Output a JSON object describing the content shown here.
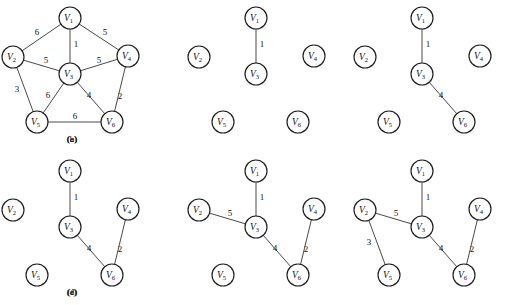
{
  "figure": {
    "background_color": "#ffffff",
    "node_stroke_color": "#1d1d1d",
    "edge_stroke_color": "#4a4a4a",
    "text_color": "#111111",
    "node_radius": 11
  },
  "vertex_labels": {
    "v1": "V",
    "v2": "V",
    "v3": "V",
    "v4": "V",
    "v5": "V",
    "v6": "V",
    "s1": "1",
    "s2": "2",
    "s3": "3",
    "s4": "4",
    "s5": "5",
    "s6": "6"
  },
  "panels": [
    {
      "id": "panel-a",
      "caption": "(a)",
      "caption_pos": {
        "x": 72,
        "y": 141
      },
      "origin": {
        "x": 0,
        "y": 0
      },
      "nodes": [
        {
          "id": "V1",
          "letter": "V",
          "sub": "1",
          "x": 70,
          "y": 18
        },
        {
          "id": "V2",
          "letter": "V",
          "sub": "2",
          "x": 13,
          "y": 57
        },
        {
          "id": "V3",
          "letter": "V",
          "sub": "3",
          "x": 70,
          "y": 74
        },
        {
          "id": "V4",
          "letter": "V",
          "sub": "4",
          "x": 128,
          "y": 56
        },
        {
          "id": "V5",
          "letter": "V",
          "sub": "5",
          "x": 37,
          "y": 122
        },
        {
          "id": "V6",
          "letter": "V",
          "sub": "6",
          "x": 112,
          "y": 122
        }
      ],
      "edges": [
        {
          "from": "V1",
          "to": "V2",
          "weight": "6",
          "label_x": 37,
          "label_y": 33
        },
        {
          "from": "V1",
          "to": "V3",
          "weight": "1",
          "label_x": 76,
          "label_y": 45
        },
        {
          "from": "V1",
          "to": "V4",
          "weight": "5",
          "label_x": 105,
          "label_y": 33
        },
        {
          "from": "V2",
          "to": "V3",
          "weight": "5",
          "label_x": 46,
          "label_y": 61
        },
        {
          "from": "V2",
          "to": "V5",
          "weight": "3",
          "label_x": 17,
          "label_y": 90
        },
        {
          "from": "V3",
          "to": "V4",
          "weight": "5",
          "label_x": 99,
          "label_y": 61
        },
        {
          "from": "V3",
          "to": "V5",
          "weight": "6",
          "label_x": 48,
          "label_y": 96
        },
        {
          "from": "V3",
          "to": "V6",
          "weight": "4",
          "label_x": 89,
          "label_y": 96
        },
        {
          "from": "V4",
          "to": "V6",
          "weight": "2",
          "label_x": 120,
          "label_y": 97
        },
        {
          "from": "V5",
          "to": "V6",
          "weight": "6",
          "label_x": 75,
          "label_y": 117
        }
      ]
    },
    {
      "id": "panel-b",
      "caption": "(b)",
      "caption_pos": {
        "x": 72,
        "y": 141
      },
      "origin": {
        "x": 186,
        "y": 0
      },
      "nodes": [
        {
          "id": "V1",
          "letter": "V",
          "sub": "1",
          "x": 70,
          "y": 18
        },
        {
          "id": "V2",
          "letter": "V",
          "sub": "2",
          "x": 13,
          "y": 57
        },
        {
          "id": "V3",
          "letter": "V",
          "sub": "3",
          "x": 70,
          "y": 74
        },
        {
          "id": "V4",
          "letter": "V",
          "sub": "4",
          "x": 128,
          "y": 56
        },
        {
          "id": "V5",
          "letter": "V",
          "sub": "5",
          "x": 37,
          "y": 122
        },
        {
          "id": "V6",
          "letter": "V",
          "sub": "6",
          "x": 112,
          "y": 122
        }
      ],
      "edges": [
        {
          "from": "V1",
          "to": "V3",
          "weight": "1",
          "label_x": 76,
          "label_y": 45
        }
      ]
    },
    {
      "id": "panel-c",
      "caption": "(c)",
      "caption_pos": {
        "x": 72,
        "y": 141
      },
      "origin": {
        "x": 352,
        "y": 0
      },
      "nodes": [
        {
          "id": "V1",
          "letter": "V",
          "sub": "1",
          "x": 70,
          "y": 18
        },
        {
          "id": "V2",
          "letter": "V",
          "sub": "2",
          "x": 13,
          "y": 57
        },
        {
          "id": "V3",
          "letter": "V",
          "sub": "3",
          "x": 70,
          "y": 74
        },
        {
          "id": "V4",
          "letter": "V",
          "sub": "4",
          "x": 128,
          "y": 56
        },
        {
          "id": "V5",
          "letter": "V",
          "sub": "5",
          "x": 37,
          "y": 122
        },
        {
          "id": "V6",
          "letter": "V",
          "sub": "6",
          "x": 112,
          "y": 122
        }
      ],
      "edges": [
        {
          "from": "V1",
          "to": "V3",
          "weight": "1",
          "label_x": 76,
          "label_y": 45
        },
        {
          "from": "V3",
          "to": "V6",
          "weight": "4",
          "label_x": 89,
          "label_y": 96
        }
      ]
    },
    {
      "id": "panel-d",
      "caption": "(d)",
      "caption_pos": {
        "x": 72,
        "y": 294
      },
      "origin": {
        "x": 0,
        "y": 153
      },
      "nodes": [
        {
          "id": "V1",
          "letter": "V",
          "sub": "1",
          "x": 70,
          "y": 18
        },
        {
          "id": "V2",
          "letter": "V",
          "sub": "2",
          "x": 13,
          "y": 57
        },
        {
          "id": "V3",
          "letter": "V",
          "sub": "3",
          "x": 70,
          "y": 74
        },
        {
          "id": "V4",
          "letter": "V",
          "sub": "4",
          "x": 128,
          "y": 56
        },
        {
          "id": "V5",
          "letter": "V",
          "sub": "5",
          "x": 37,
          "y": 122
        },
        {
          "id": "V6",
          "letter": "V",
          "sub": "6",
          "x": 112,
          "y": 122
        }
      ],
      "edges": [
        {
          "from": "V1",
          "to": "V3",
          "weight": "1",
          "label_x": 76,
          "label_y": 45
        },
        {
          "from": "V3",
          "to": "V6",
          "weight": "4",
          "label_x": 89,
          "label_y": 96
        },
        {
          "from": "V4",
          "to": "V6",
          "weight": "2",
          "label_x": 120,
          "label_y": 97
        }
      ]
    },
    {
      "id": "panel-e",
      "caption": "(e)",
      "caption_pos": {
        "x": 72,
        "y": 294
      },
      "origin": {
        "x": 186,
        "y": 153
      },
      "nodes": [
        {
          "id": "V1",
          "letter": "V",
          "sub": "1",
          "x": 70,
          "y": 18
        },
        {
          "id": "V2",
          "letter": "V",
          "sub": "2",
          "x": 13,
          "y": 57
        },
        {
          "id": "V3",
          "letter": "V",
          "sub": "3",
          "x": 70,
          "y": 74
        },
        {
          "id": "V4",
          "letter": "V",
          "sub": "4",
          "x": 128,
          "y": 56
        },
        {
          "id": "V5",
          "letter": "V",
          "sub": "5",
          "x": 37,
          "y": 122
        },
        {
          "id": "V6",
          "letter": "V",
          "sub": "6",
          "x": 112,
          "y": 122
        }
      ],
      "edges": [
        {
          "from": "V1",
          "to": "V3",
          "weight": "1",
          "label_x": 76,
          "label_y": 45
        },
        {
          "from": "V2",
          "to": "V3",
          "weight": "5",
          "label_x": 44,
          "label_y": 61
        },
        {
          "from": "V3",
          "to": "V6",
          "weight": "4",
          "label_x": 89,
          "label_y": 96
        },
        {
          "from": "V4",
          "to": "V6",
          "weight": "2",
          "label_x": 120,
          "label_y": 97
        }
      ]
    },
    {
      "id": "panel-f",
      "caption": "(f)",
      "caption_pos": {
        "x": 72,
        "y": 294
      },
      "origin": {
        "x": 352,
        "y": 153
      },
      "nodes": [
        {
          "id": "V1",
          "letter": "V",
          "sub": "1",
          "x": 70,
          "y": 18
        },
        {
          "id": "V2",
          "letter": "V",
          "sub": "2",
          "x": 13,
          "y": 57
        },
        {
          "id": "V3",
          "letter": "V",
          "sub": "3",
          "x": 70,
          "y": 74
        },
        {
          "id": "V4",
          "letter": "V",
          "sub": "4",
          "x": 128,
          "y": 56
        },
        {
          "id": "V5",
          "letter": "V",
          "sub": "5",
          "x": 37,
          "y": 122
        },
        {
          "id": "V6",
          "letter": "V",
          "sub": "6",
          "x": 112,
          "y": 122
        }
      ],
      "edges": [
        {
          "from": "V1",
          "to": "V3",
          "weight": "1",
          "label_x": 76,
          "label_y": 45
        },
        {
          "from": "V2",
          "to": "V3",
          "weight": "5",
          "label_x": 44,
          "label_y": 61
        },
        {
          "from": "V2",
          "to": "V5",
          "weight": "3",
          "label_x": 17,
          "label_y": 90
        },
        {
          "from": "V3",
          "to": "V6",
          "weight": "4",
          "label_x": 89,
          "label_y": 96
        },
        {
          "from": "V4",
          "to": "V6",
          "weight": "2",
          "label_x": 120,
          "label_y": 97
        }
      ]
    }
  ],
  "chart_data": {
    "type": "diagram",
    "vertices": [
      "V1",
      "V2",
      "V3",
      "V4",
      "V5",
      "V6"
    ],
    "full_graph_edges": [
      {
        "u": "V1",
        "v": "V2",
        "w": 6
      },
      {
        "u": "V1",
        "v": "V3",
        "w": 1
      },
      {
        "u": "V1",
        "v": "V4",
        "w": 5
      },
      {
        "u": "V2",
        "v": "V3",
        "w": 5
      },
      {
        "u": "V2",
        "v": "V5",
        "w": 3
      },
      {
        "u": "V3",
        "v": "V4",
        "w": 5
      },
      {
        "u": "V3",
        "v": "V5",
        "w": 6
      },
      {
        "u": "V3",
        "v": "V6",
        "w": 4
      },
      {
        "u": "V4",
        "v": "V6",
        "w": 2
      },
      {
        "u": "V5",
        "v": "V6",
        "w": 6
      }
    ],
    "steps": [
      {
        "panel": "(a)",
        "edges": [
          "V1-V2:6",
          "V1-V3:1",
          "V1-V4:5",
          "V2-V3:5",
          "V2-V5:3",
          "V3-V4:5",
          "V3-V5:6",
          "V3-V6:4",
          "V4-V6:2",
          "V5-V6:6"
        ]
      },
      {
        "panel": "(b)",
        "edges": [
          "V1-V3:1"
        ]
      },
      {
        "panel": "(c)",
        "edges": [
          "V1-V3:1",
          "V3-V6:4"
        ]
      },
      {
        "panel": "(d)",
        "edges": [
          "V1-V3:1",
          "V3-V6:4",
          "V4-V6:2"
        ]
      },
      {
        "panel": "(e)",
        "edges": [
          "V1-V3:1",
          "V2-V3:5",
          "V3-V6:4",
          "V4-V6:2"
        ]
      },
      {
        "panel": "(f)",
        "edges": [
          "V1-V3:1",
          "V2-V3:5",
          "V2-V5:3",
          "V3-V6:4",
          "V4-V6:2"
        ]
      }
    ]
  }
}
